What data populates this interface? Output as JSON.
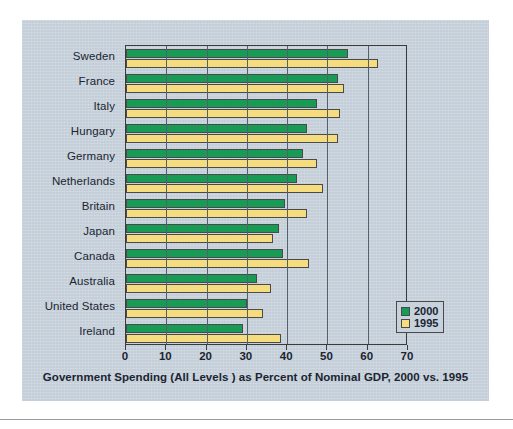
{
  "chart_data": {
    "type": "bar",
    "orientation": "horizontal",
    "title": "",
    "xlabel": "Government Spending (All Levels ) as Percent of Nominal GDP, 2000 vs. 1995",
    "ylabel": "",
    "xlim": [
      0,
      70
    ],
    "xticks": [
      0,
      10,
      20,
      30,
      40,
      50,
      60,
      70
    ],
    "xtick_labels": [
      "0",
      "10",
      "20",
      "30",
      "40",
      "50",
      "60",
      "70"
    ],
    "grid": true,
    "grid_axis": "x",
    "legend_position": "lower-right",
    "categories": [
      "Sweden",
      "France",
      "Italy",
      "Hungary",
      "Germany",
      "Netherlands",
      "Britain",
      "Japan",
      "Canada",
      "Australia",
      "United States",
      "Ireland"
    ],
    "series": [
      {
        "name": "2000",
        "color": "#189c55",
        "values": [
          55.0,
          52.5,
          47.5,
          45.0,
          44.0,
          42.5,
          39.5,
          38.0,
          39.0,
          32.5,
          30.0,
          29.0
        ]
      },
      {
        "name": "1995",
        "color": "#f5dc7e",
        "values": [
          62.5,
          54.0,
          53.0,
          52.5,
          47.5,
          49.0,
          45.0,
          36.5,
          45.5,
          36.0,
          34.0,
          38.5
        ]
      }
    ]
  },
  "legend": {
    "entries": [
      {
        "label": "2000",
        "color": "#189c55"
      },
      {
        "label": "1995",
        "color": "#f5dc7e"
      }
    ]
  },
  "colors": {
    "panel_background": "#c3ced9",
    "series_2000": "#189c55",
    "series_1995": "#f5dc7e",
    "axis": "#3b3b3b",
    "text": "#1b2430"
  }
}
